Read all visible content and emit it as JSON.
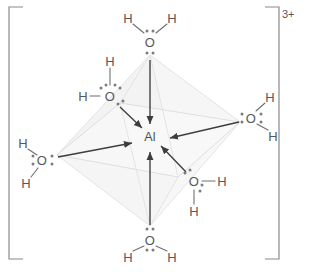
{
  "figure": {
    "central_atom": "Al",
    "charge": "3+",
    "ligand_count": 6,
    "geometry": "octahedral",
    "colors": {
      "text": "#58585a",
      "bond_line": "#6f6f71",
      "arrow": "#3d3d3f",
      "dot": "#7c7c7e",
      "bracket": "#77777a",
      "face_fill": "#e8e8e8",
      "edge_faint": "#e2e2e2",
      "background": "#ffffff"
    }
  },
  "brackets": {
    "left": "[",
    "right": "]",
    "charge": "3+"
  },
  "center": {
    "symbol": "Al",
    "x": 150,
    "y": 137
  },
  "ligands": [
    {
      "id": "water-top",
      "position": "top",
      "oxygen": {
        "symbol": "O",
        "x": 150,
        "y": 42
      },
      "hydrogens": [
        {
          "symbol": "H",
          "x": 128,
          "y": 18
        },
        {
          "symbol": "H",
          "x": 172,
          "y": 18
        }
      ],
      "lone_pairs": [
        {
          "placement": "above",
          "x": 150,
          "y": 31
        },
        {
          "placement": "below",
          "x": 150,
          "y": 53
        }
      ]
    },
    {
      "id": "water-upper-left",
      "position": "upper-left",
      "oxygen": {
        "symbol": "O",
        "x": 110,
        "y": 96
      },
      "hydrogens": [
        {
          "symbol": "H",
          "x": 110,
          "y": 61
        },
        {
          "symbol": "H",
          "x": 83,
          "y": 96
        }
      ],
      "lone_pairs": [
        {
          "placement": "upper-left",
          "x": 101,
          "y": 88
        },
        {
          "placement": "upper-right",
          "x": 119,
          "y": 88
        },
        {
          "placement": "lower-right",
          "x": 119,
          "y": 105
        }
      ]
    },
    {
      "id": "water-left",
      "position": "left",
      "oxygen": {
        "symbol": "O",
        "x": 42,
        "y": 160
      },
      "hydrogens": [
        {
          "symbol": "H",
          "x": 23,
          "y": 143
        },
        {
          "symbol": "H",
          "x": 26,
          "y": 183
        }
      ],
      "lone_pairs": [
        {
          "placement": "left",
          "x": 33,
          "y": 160
        },
        {
          "placement": "right",
          "x": 52,
          "y": 160
        }
      ]
    },
    {
      "id": "water-right",
      "position": "right",
      "oxygen": {
        "symbol": "O",
        "x": 251,
        "y": 118
      },
      "hydrogens": [
        {
          "symbol": "H",
          "x": 270,
          "y": 97
        },
        {
          "symbol": "H",
          "x": 273,
          "y": 136
        }
      ],
      "lone_pairs": [
        {
          "placement": "left",
          "x": 242,
          "y": 118
        },
        {
          "placement": "right",
          "x": 261,
          "y": 118
        }
      ]
    },
    {
      "id": "water-lower-right",
      "position": "lower-right",
      "oxygen": {
        "symbol": "O",
        "x": 194,
        "y": 181
      },
      "hydrogens": [
        {
          "symbol": "H",
          "x": 222,
          "y": 181
        },
        {
          "symbol": "H",
          "x": 194,
          "y": 211
        }
      ],
      "lone_pairs": [
        {
          "placement": "upper-left",
          "x": 185,
          "y": 173
        },
        {
          "placement": "lower-right",
          "x": 203,
          "y": 189
        }
      ]
    },
    {
      "id": "water-bottom",
      "position": "bottom",
      "oxygen": {
        "symbol": "O",
        "x": 150,
        "y": 240
      },
      "hydrogens": [
        {
          "symbol": "H",
          "x": 128,
          "y": 257
        },
        {
          "symbol": "H",
          "x": 172,
          "y": 257
        }
      ],
      "lone_pairs": [
        {
          "placement": "above",
          "x": 150,
          "y": 229
        },
        {
          "placement": "below",
          "x": 150,
          "y": 250
        }
      ]
    }
  ],
  "dative_bonds": [
    {
      "from": "water-top",
      "to": "Al",
      "label": "O to Al coordinate bond"
    },
    {
      "from": "water-upper-left",
      "to": "Al",
      "label": "O to Al coordinate bond"
    },
    {
      "from": "water-left",
      "to": "Al",
      "label": "O to Al coordinate bond"
    },
    {
      "from": "water-right",
      "to": "Al",
      "label": "O to Al coordinate bond"
    },
    {
      "from": "water-lower-right",
      "to": "Al",
      "label": "O to Al coordinate bond"
    },
    {
      "from": "water-bottom",
      "to": "Al",
      "label": "O to Al coordinate bond"
    }
  ]
}
